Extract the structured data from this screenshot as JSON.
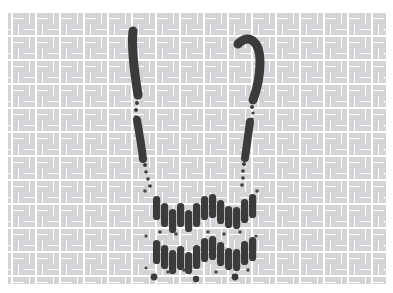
{
  "artwork": {
    "title": "Stitched Skull Face on Woven Fabric",
    "medium": "embroidery-stitch-motif",
    "canvas": {
      "width": 393,
      "height": 293,
      "background_color": "#ffffff"
    },
    "background": {
      "name": "basket-weave-fabric",
      "pattern_type": "basket-weave",
      "tile_size": 12,
      "brick_length": 11,
      "brick_thickness": 4,
      "base_color": "#ffffff",
      "thread_color": "#d2d2d4",
      "thread_color_alt": "#c2c2c6",
      "field": {
        "x": 8,
        "y": 12,
        "width": 378,
        "height": 272
      }
    },
    "stitch_color": "#3b3b3b",
    "stitch_color_soft": "#4a4a4a",
    "strokes": [
      {
        "name": "left-eye-stroke",
        "kind": "curved-stroke",
        "color": "#3b3b3b",
        "width": 9,
        "path": "M 133 31 C 131 48, 134 70, 138 95"
      },
      {
        "name": "right-eye-stroke",
        "kind": "curved-hook-stroke",
        "color": "#3b3b3b",
        "width": 9,
        "path": "M 238 44 C 249 33, 260 41, 260 62 C 260 78, 256 92, 253 100"
      },
      {
        "name": "left-cheek-stroke",
        "kind": "straight-stroke",
        "color": "#3b3b3b",
        "width": 8,
        "path": "M 137 120 C 140 137, 142 150, 143 159"
      },
      {
        "name": "right-cheek-stroke",
        "kind": "straight-stroke",
        "color": "#3b3b3b",
        "width": 8,
        "path": "M 250 122 C 248 137, 246 150, 245 158"
      }
    ],
    "dot_trails": [
      {
        "name": "left-upper-dot-trail",
        "dots": [
          {
            "cx": 137,
            "cy": 103,
            "r": 2.0
          },
          {
            "cx": 136,
            "cy": 110,
            "r": 2.0
          },
          {
            "cx": 136,
            "cy": 117,
            "r": 1.8
          }
        ]
      },
      {
        "name": "right-upper-dot-trail",
        "dots": [
          {
            "cx": 252,
            "cy": 107,
            "r": 2.0
          },
          {
            "cx": 253,
            "cy": 113,
            "r": 1.6
          },
          {
            "cx": 252,
            "cy": 119,
            "r": 1.6
          }
        ]
      },
      {
        "name": "left-lower-dot-trail",
        "dots": [
          {
            "cx": 145,
            "cy": 165,
            "r": 2.0
          },
          {
            "cx": 146,
            "cy": 172,
            "r": 1.8
          },
          {
            "cx": 148,
            "cy": 179,
            "r": 1.8
          },
          {
            "cx": 150,
            "cy": 186,
            "r": 1.8
          }
        ]
      },
      {
        "name": "right-lower-dot-trail",
        "dots": [
          {
            "cx": 244,
            "cy": 164,
            "r": 2.0
          },
          {
            "cx": 243,
            "cy": 171,
            "r": 1.8
          },
          {
            "cx": 243,
            "cy": 178,
            "r": 1.8
          },
          {
            "cx": 242,
            "cy": 185,
            "r": 1.8
          }
        ]
      }
    ],
    "teeth_rows": [
      {
        "name": "upper-teeth-row",
        "stitches": [
          {
            "x": 153,
            "y": 196,
            "h": 24
          },
          {
            "x": 161,
            "y": 203,
            "h": 24
          },
          {
            "x": 169,
            "y": 209,
            "h": 24
          },
          {
            "x": 177,
            "y": 203,
            "h": 24
          },
          {
            "x": 185,
            "y": 210,
            "h": 22
          },
          {
            "x": 193,
            "y": 203,
            "h": 24
          },
          {
            "x": 201,
            "y": 196,
            "h": 24
          },
          {
            "x": 209,
            "y": 194,
            "h": 24
          },
          {
            "x": 217,
            "y": 200,
            "h": 24
          },
          {
            "x": 225,
            "y": 206,
            "h": 22
          },
          {
            "x": 233,
            "y": 207,
            "h": 22
          },
          {
            "x": 241,
            "y": 199,
            "h": 24
          },
          {
            "x": 249,
            "y": 194,
            "h": 24
          }
        ]
      },
      {
        "name": "lower-teeth-row",
        "stitches": [
          {
            "x": 153,
            "y": 240,
            "h": 24
          },
          {
            "x": 161,
            "y": 245,
            "h": 24
          },
          {
            "x": 169,
            "y": 250,
            "h": 24
          },
          {
            "x": 177,
            "y": 246,
            "h": 24
          },
          {
            "x": 185,
            "y": 252,
            "h": 22
          },
          {
            "x": 193,
            "y": 245,
            "h": 24
          },
          {
            "x": 201,
            "y": 238,
            "h": 24
          },
          {
            "x": 209,
            "y": 236,
            "h": 24
          },
          {
            "x": 217,
            "y": 242,
            "h": 24
          },
          {
            "x": 225,
            "y": 248,
            "h": 22
          },
          {
            "x": 233,
            "y": 249,
            "h": 22
          },
          {
            "x": 241,
            "y": 241,
            "h": 24
          },
          {
            "x": 249,
            "y": 237,
            "h": 24
          }
        ]
      }
    ],
    "base_dots": [
      {
        "name": "base-dot-left",
        "cx": 154,
        "cy": 277,
        "r": 3.4
      },
      {
        "name": "base-dot-center",
        "cx": 196,
        "cy": 279,
        "r": 3.2
      },
      {
        "name": "base-dot-right",
        "cx": 235,
        "cy": 277,
        "r": 3.4
      }
    ],
    "scatter_stitches": [
      {
        "cx": 145,
        "cy": 191,
        "r": 1.8
      },
      {
        "cx": 257,
        "cy": 191,
        "r": 1.8
      },
      {
        "cx": 160,
        "cy": 232,
        "r": 1.8
      },
      {
        "cx": 176,
        "cy": 234,
        "r": 1.8
      },
      {
        "cx": 208,
        "cy": 232,
        "r": 1.8
      },
      {
        "cx": 224,
        "cy": 234,
        "r": 1.8
      },
      {
        "cx": 240,
        "cy": 232,
        "r": 1.8
      },
      {
        "cx": 146,
        "cy": 236,
        "r": 1.6
      },
      {
        "cx": 256,
        "cy": 236,
        "r": 1.6
      },
      {
        "cx": 168,
        "cy": 272,
        "r": 1.8
      },
      {
        "cx": 184,
        "cy": 270,
        "r": 1.8
      },
      {
        "cx": 216,
        "cy": 272,
        "r": 1.8
      },
      {
        "cx": 248,
        "cy": 270,
        "r": 1.8
      },
      {
        "cx": 146,
        "cy": 268,
        "r": 1.6
      }
    ]
  }
}
